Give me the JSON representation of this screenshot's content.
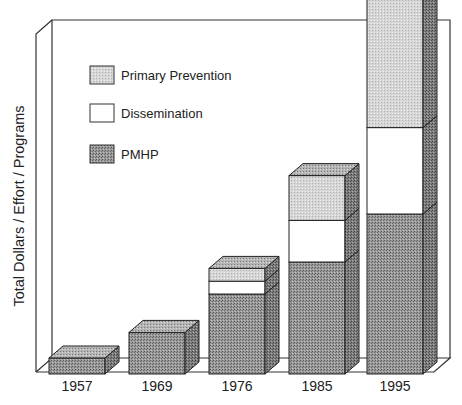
{
  "chart_data": {
    "type": "bar",
    "stacked": true,
    "three_d": true,
    "title": "",
    "xlabel": "",
    "ylabel": "Total Dollars / Effort / Programs",
    "categories": [
      "1957",
      "1969",
      "1976",
      "1985",
      "1995"
    ],
    "series": [
      {
        "name": "PMHP",
        "values": [
          5,
          13,
          25,
          35,
          50
        ],
        "pattern": "dark-stipple",
        "color": "#8c8c8c"
      },
      {
        "name": "Dissemination",
        "values": [
          0,
          0,
          4,
          13,
          27
        ],
        "pattern": "white",
        "color": "#ffffff"
      },
      {
        "name": "Primary Prevention",
        "values": [
          0,
          0,
          4,
          14,
          53
        ],
        "pattern": "light-stipple",
        "color": "#cfcfcf"
      }
    ],
    "ylim": [
      0,
      100
    ],
    "grid": false,
    "y_ticks_shown": false,
    "legend": {
      "position": "upper-left-inside",
      "entries": [
        "Primary Prevention",
        "Dissemination",
        "PMHP"
      ]
    }
  },
  "legend": {
    "items": [
      {
        "label": "Primary Prevention"
      },
      {
        "label": "Dissemination"
      },
      {
        "label": "PMHP"
      }
    ]
  },
  "axis": {
    "ylabel": "Total Dollars / Effort / Programs",
    "x_ticks": [
      "1957",
      "1969",
      "1976",
      "1985",
      "1995"
    ]
  }
}
